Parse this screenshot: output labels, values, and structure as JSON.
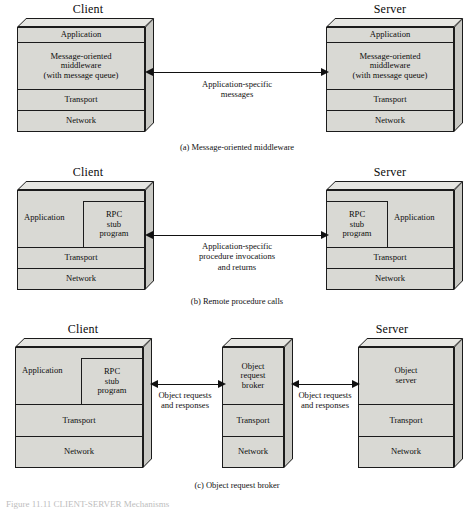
{
  "figure": {
    "caption_bottom": "Figure 11.11   CLIENT-SERVER Mechanisms",
    "panels": [
      {
        "id": "a",
        "caption": "(a) Message-oriented middleware",
        "left_role": "Client",
        "right_role": "Server",
        "arrow_label_line1": "Application-specific",
        "arrow_label_line2": "messages",
        "left_layers": [
          "Application",
          "Message-oriented\nmiddleware\n(with message queue)",
          "Transport",
          "Network"
        ],
        "right_layers": [
          "Application",
          "Message-oriented\nmiddleware\n(with message queue)",
          "Transport",
          "Network"
        ]
      },
      {
        "id": "b",
        "caption": "(b) Remote procedure calls",
        "left_role": "Client",
        "right_role": "Server",
        "arrow_label_line1": "Application-specific",
        "arrow_label_line2": "procedure invocations",
        "arrow_label_line3": "and returns",
        "application_label": "Application",
        "stub_label": "RPC\nstub\nprogram",
        "left_layers": [
          "Application",
          "Transport",
          "Network"
        ],
        "right_layers": [
          "Application",
          "Transport",
          "Network"
        ]
      },
      {
        "id": "c",
        "caption": "(c) Object request broker",
        "left_role": "Client",
        "right_role": "Server",
        "arrow_label_left_line1": "Object requests",
        "arrow_label_left_line2": "and responses",
        "arrow_label_right_line1": "Object requests",
        "arrow_label_right_line2": "and responses",
        "application_label": "Application",
        "stub_label": "RPC\nstub\nprogram",
        "middle_layers": [
          "Object\nrequest\nbroker",
          "Transport",
          "Network"
        ],
        "client_layers": [
          "Application",
          "Transport",
          "Network"
        ],
        "server_layers": [
          "Object\nserver",
          "Transport",
          "Network"
        ]
      }
    ]
  },
  "colors": {
    "box_fill": "#d9d9d4",
    "box_top": "#e6e6e2",
    "box_side": "#c9c9c4",
    "stroke": "#1b1b1b",
    "text": "#0d0d0d"
  }
}
